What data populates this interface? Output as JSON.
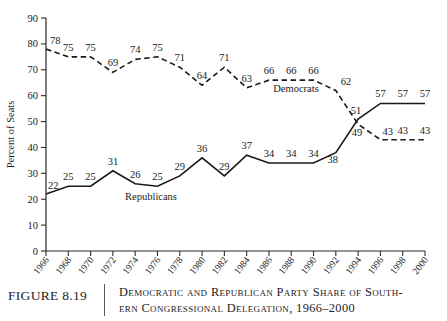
{
  "figure": {
    "number_label": "FIGURE 8.19",
    "caption_line1": "Democratic and Republican Party Share of South-",
    "caption_line2": "ern Congressional Delegation, 1966–2000"
  },
  "chart_data": {
    "type": "line",
    "title": "",
    "xlabel": "",
    "ylabel": "Percent of Seats",
    "ylim": [
      0,
      90
    ],
    "ytick_values": [
      0,
      10,
      20,
      30,
      40,
      50,
      60,
      70,
      80,
      90
    ],
    "ytick_labels": [
      "0",
      "10",
      "20",
      "30",
      "40",
      "50",
      "60",
      "70",
      "80",
      "90"
    ],
    "grid": false,
    "legend_position": "inline-annotations",
    "categories": [
      "1966",
      "1968",
      "1970",
      "1972",
      "1974",
      "1976",
      "1978",
      "1980",
      "1982",
      "1984",
      "1986",
      "1988",
      "1990",
      "1992",
      "1994",
      "1996",
      "1998",
      "2000"
    ],
    "x": [
      1966,
      1968,
      1970,
      1972,
      1974,
      1976,
      1978,
      1980,
      1982,
      1984,
      1986,
      1988,
      1990,
      1992,
      1994,
      1996,
      1998,
      2000
    ],
    "series": [
      {
        "name": "Democrats",
        "style": "dashed",
        "color": "#1a1a1a",
        "inline_label": "Democrats",
        "values": [
          78,
          75,
          75,
          69,
          74,
          75,
          71,
          64,
          71,
          63,
          66,
          66,
          66,
          62,
          49,
          43,
          43,
          43
        ],
        "point_labels": [
          "78",
          "75",
          "75",
          "69",
          "74",
          "75",
          "71",
          "64",
          "71",
          "63",
          "66",
          "66",
          "66",
          "62",
          "49",
          "43",
          "43",
          "43"
        ]
      },
      {
        "name": "Republicans",
        "style": "solid",
        "color": "#1a1a1a",
        "inline_label": "Republicans",
        "values": [
          22,
          25,
          25,
          31,
          26,
          25,
          29,
          36,
          29,
          37,
          34,
          34,
          34,
          38,
          51,
          57,
          57,
          57
        ],
        "point_labels": [
          "22",
          "25",
          "25",
          "31",
          "26",
          "25",
          "29",
          "36",
          "29",
          "37",
          "34",
          "34",
          "34",
          "38",
          "51",
          "57",
          "57",
          "57"
        ]
      }
    ]
  }
}
